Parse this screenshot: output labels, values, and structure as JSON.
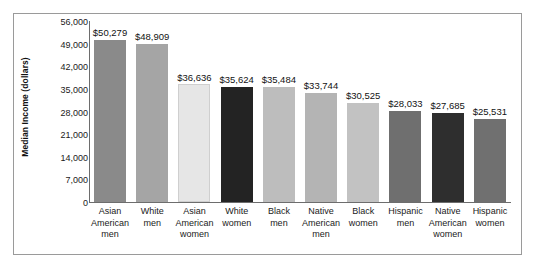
{
  "chart_data": {
    "type": "bar",
    "title": "",
    "xlabel": "",
    "ylabel": "Median Income (dollars)",
    "ylim": [
      0,
      56000
    ],
    "grid": false,
    "legend": null,
    "ytick_labels": [
      "56,000",
      "49,000",
      "42,000",
      "35,000",
      "28,000",
      "21,000",
      "14,000",
      "7,000",
      "0"
    ],
    "ytick_values": [
      56000,
      49000,
      42000,
      35000,
      28000,
      21000,
      14000,
      7000,
      0
    ],
    "categories": [
      "Asian American men",
      "White men",
      "Asian American women",
      "White women",
      "Black men",
      "Native American men",
      "Black women",
      "Hispanic men",
      "Native American women",
      "Hispanic women"
    ],
    "category_lines": [
      [
        "Asian",
        "American",
        "men"
      ],
      [
        "White",
        "men"
      ],
      [
        "Asian",
        "American",
        "women"
      ],
      [
        "White",
        "women"
      ],
      [
        "Black",
        "men"
      ],
      [
        "Native",
        "American",
        "men"
      ],
      [
        "Black",
        "women"
      ],
      [
        "Hispanic",
        "men"
      ],
      [
        "Native",
        "American",
        "women"
      ],
      [
        "Hispanic",
        "women"
      ]
    ],
    "values": [
      50279,
      48909,
      36636,
      35624,
      35484,
      33744,
      30525,
      28033,
      27685,
      25531
    ],
    "value_labels": [
      "$50,279",
      "$48,909",
      "$36,636",
      "$35,624",
      "$35,484",
      "$33,744",
      "$30,525",
      "$28,033",
      "$27,685",
      "$25,531"
    ],
    "bar_colors": [
      "#8a8a8a",
      "#a5a5a5",
      "#e6e6e6",
      "#232323",
      "#bdbdbd",
      "#b4b4b4",
      "#c2c2c2",
      "#6f6f6f",
      "#2e2e2e",
      "#707070"
    ]
  },
  "figure": {
    "border_color": "#9a9a9a",
    "background": "#ffffff",
    "axis_color": "#6d6d6d"
  }
}
